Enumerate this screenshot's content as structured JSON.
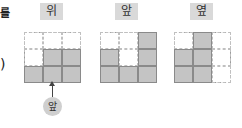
{
  "side": {
    "top_char": "를",
    "paren": ")"
  },
  "views": [
    {
      "label": "위",
      "filled": [
        [
          0,
          0,
          0
        ],
        [
          0,
          1,
          1
        ],
        [
          1,
          1,
          1
        ]
      ]
    },
    {
      "label": "앞",
      "filled": [
        [
          0,
          0,
          1
        ],
        [
          1,
          0,
          1
        ],
        [
          1,
          1,
          1
        ]
      ]
    },
    {
      "label": "옆",
      "filled": [
        [
          0,
          1,
          0
        ],
        [
          1,
          1,
          0
        ],
        [
          1,
          1,
          0
        ]
      ]
    }
  ],
  "front_marker": {
    "label": "앞"
  },
  "colors": {
    "filled": "#c4c4c4",
    "label_bg": "#d9d9d9"
  }
}
